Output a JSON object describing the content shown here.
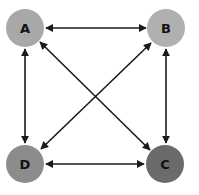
{
  "diagram": {
    "nodes": [
      {
        "id": "A",
        "label": "A",
        "color": "#a8a8a8"
      },
      {
        "id": "B",
        "label": "B",
        "color": "#b0b0b0"
      },
      {
        "id": "C",
        "label": "C",
        "color": "#6b6b6b"
      },
      {
        "id": "D",
        "label": "D",
        "color": "#8c8c8c"
      }
    ],
    "edges": [
      {
        "from": "A",
        "to": "B",
        "direction": "both"
      },
      {
        "from": "A",
        "to": "D",
        "direction": "both"
      },
      {
        "from": "B",
        "to": "C",
        "direction": "both"
      },
      {
        "from": "D",
        "to": "C",
        "direction": "both"
      },
      {
        "from": "A",
        "to": "C",
        "direction": "both"
      },
      {
        "from": "B",
        "to": "D",
        "direction": "both"
      }
    ]
  }
}
